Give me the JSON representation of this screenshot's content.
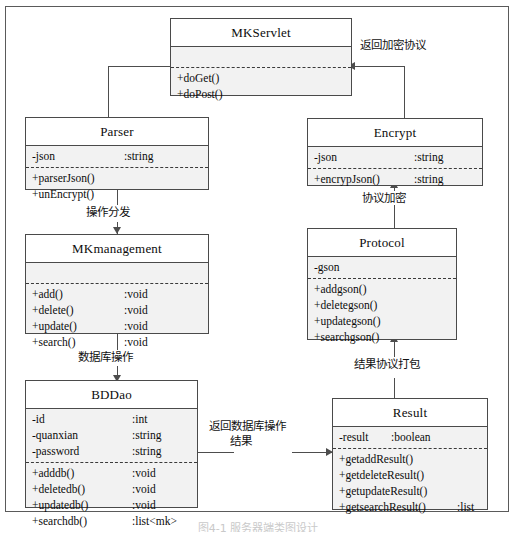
{
  "diagram": {
    "kind": "uml-class-diagram",
    "caption": "图4-1 服务器端类图设计",
    "classes": [
      {
        "id": "mkservlet",
        "name": "MKServlet",
        "attributes": [],
        "methods": [
          {
            "name": "+doGet()",
            "type": ""
          },
          {
            "name": "+doPost()",
            "type": ""
          }
        ]
      },
      {
        "id": "parser",
        "name": "Parser",
        "attributes": [
          {
            "name": "-json",
            "type": ":string"
          }
        ],
        "methods": [
          {
            "name": "+parserJson()",
            "type": ""
          },
          {
            "name": "+unEncrypt()",
            "type": ""
          }
        ]
      },
      {
        "id": "encrypt",
        "name": "Encrypt",
        "attributes": [
          {
            "name": "-json",
            "type": ":string"
          }
        ],
        "methods": [
          {
            "name": "+encrypJson()",
            "type": ":string"
          }
        ]
      },
      {
        "id": "mkmanagement",
        "name": "MKmanagement",
        "attributes": [],
        "methods": [
          {
            "name": "+add()",
            "type": ":void"
          },
          {
            "name": "+delete()",
            "type": ":void"
          },
          {
            "name": "+update()",
            "type": ":void"
          },
          {
            "name": "+search()",
            "type": ":void"
          }
        ]
      },
      {
        "id": "protocol",
        "name": "Protocol",
        "attributes": [
          {
            "name": "-gson",
            "type": ""
          }
        ],
        "methods": [
          {
            "name": "+addgson()",
            "type": ""
          },
          {
            "name": "+deletegson()",
            "type": ""
          },
          {
            "name": "+updategson()",
            "type": ""
          },
          {
            "name": "+searchgson()",
            "type": ""
          }
        ]
      },
      {
        "id": "bddao",
        "name": "BDDao",
        "attributes": [
          {
            "name": "-id",
            "type": ":int"
          },
          {
            "name": "-quanxian",
            "type": ":string"
          },
          {
            "name": "-password",
            "type": ":string"
          }
        ],
        "methods": [
          {
            "name": "+adddb()",
            "type": ":void"
          },
          {
            "name": "+deletedb()",
            "type": ":void"
          },
          {
            "name": "+updatedb()",
            "type": ":void"
          },
          {
            "name": "+searchdb()",
            "type": ":list<mk>"
          }
        ]
      },
      {
        "id": "result",
        "name": "Result",
        "attributes": [
          {
            "name": "-result",
            "type": ":boolean"
          }
        ],
        "methods": [
          {
            "name": "+getaddResult()",
            "type": ""
          },
          {
            "name": "+getdeleteResult()",
            "type": ""
          },
          {
            "name": "+getupdateResult()",
            "type": ""
          },
          {
            "name": "+getsearchResult()",
            "type": ":list"
          }
        ]
      }
    ],
    "edge_labels": [
      {
        "id": "return-encrypted-protocol",
        "text": "返回加密协议"
      },
      {
        "id": "operation-dispatch",
        "text": "操作分发"
      },
      {
        "id": "protocol-encrypt",
        "text": "协议加密"
      },
      {
        "id": "database-operation",
        "text": "数据库操作"
      },
      {
        "id": "result-protocol-package",
        "text": "结果协议打包"
      },
      {
        "id": "return-db-result-line1",
        "text": "返回数据库操作"
      },
      {
        "id": "return-db-result-line2",
        "text": "结果"
      }
    ],
    "colors": {
      "box_fill": "#f2f2f2",
      "title_fill": "#ffffff",
      "stroke": "#4a4a4a",
      "frame": "#5a5a5a",
      "text": "#0c0c0c"
    }
  }
}
